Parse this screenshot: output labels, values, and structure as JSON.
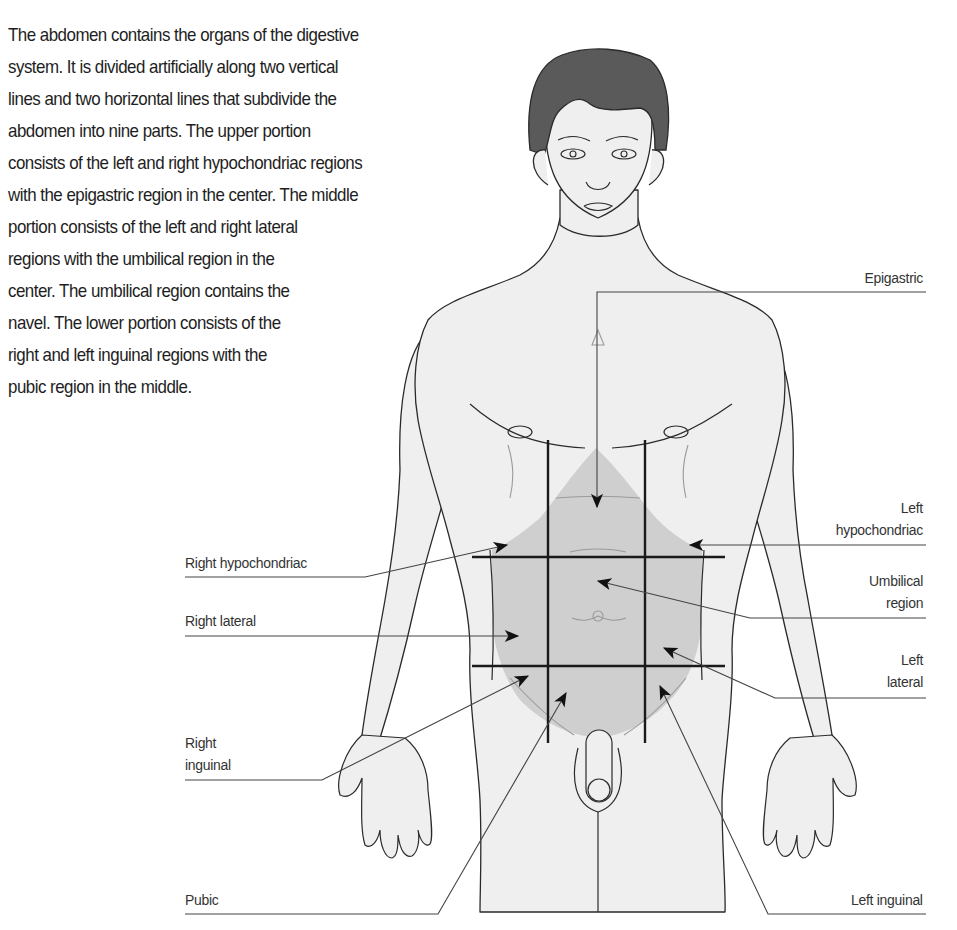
{
  "intro": {
    "lines": [
      "The abdomen contains the organs of the digestive",
      "system. It is divided artificially along two vertical",
      "lines and two horizontal lines that subdivide the",
      "abdomen into nine parts. The upper portion",
      "consists of the left and right hypochondriac regions",
      "with the epigastric region in the center. The middle",
      "portion consists of the left and right lateral",
      "regions with the umbilical region in the",
      "center. The umbilical region contains the",
      "navel. The lower portion consists of the",
      "right and left inguinal regions with the",
      "pubic region in the middle."
    ]
  },
  "figure": {
    "colors": {
      "skin": "#efefef",
      "outline": "#2a2a2a",
      "hair": "#5a5a5a",
      "abdomen_shade": "#cfcfcf",
      "grid_lines": "#1a1a1a",
      "leader_lines": "#555555"
    },
    "labels": {
      "epigastric": [
        "Epigastric"
      ],
      "left_hypochondriac": [
        "Left",
        "hypochondriac"
      ],
      "umbilical": [
        "Umbilical",
        "region"
      ],
      "left_lateral": [
        "Left",
        "lateral"
      ],
      "left_inguinal": [
        "Left inguinal"
      ],
      "right_hypochondriac": [
        "Right hypochondriac"
      ],
      "right_lateral": [
        "Right lateral"
      ],
      "right_inguinal": [
        "Right",
        "inguinal"
      ],
      "pubic": [
        "Pubic"
      ]
    }
  }
}
